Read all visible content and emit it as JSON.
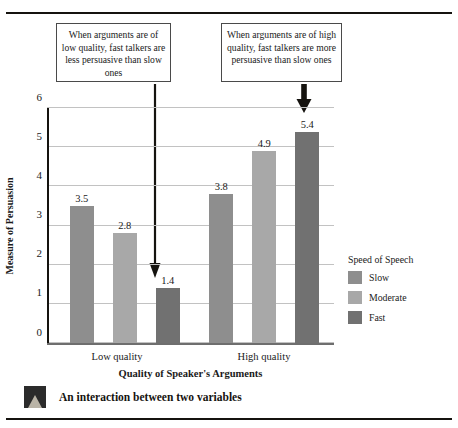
{
  "figure": {
    "caption": "An interaction between two variables",
    "caption_thumb_icon": "photo-thumbnail-icon"
  },
  "annotations": [
    {
      "id": "low-quality-note",
      "text": "When arguments are of low quality, fast talkers are less persuasive than slow ones",
      "arrow_icon": "down-arrow-icon",
      "points_to": "Low quality / Fast bar (1.4)"
    },
    {
      "id": "high-quality-note",
      "text": "When arguments are of high quality, fast talkers are more persuasive than slow ones",
      "arrow_icon": "down-arrow-icon",
      "points_to": "High quality / Fast bar (5.4)"
    }
  ],
  "legend": {
    "title": "Speed of Speech",
    "items": [
      {
        "label": "Slow",
        "color": "#8e8e8e"
      },
      {
        "label": "Moderate",
        "color": "#a8a8a8"
      },
      {
        "label": "Fast",
        "color": "#717171"
      }
    ]
  },
  "chart_data": {
    "type": "bar",
    "title": "",
    "xlabel": "Quality of Speaker's Arguments",
    "ylabel": "Measure of Persuasion",
    "categories": [
      "Low quality",
      "High quality"
    ],
    "series": [
      {
        "name": "Slow",
        "color": "#8e8e8e",
        "values": [
          3.5,
          3.8
        ]
      },
      {
        "name": "Moderate",
        "color": "#a8a8a8",
        "values": [
          2.8,
          4.9
        ]
      },
      {
        "name": "Fast",
        "color": "#717171",
        "values": [
          1.4,
          5.4
        ]
      }
    ],
    "ylim": [
      0,
      6
    ],
    "yticks": [
      0,
      1,
      2,
      3,
      4,
      5,
      6
    ],
    "ytick_labels": [
      "0",
      "1",
      "2",
      "3",
      "4",
      "5",
      "6"
    ],
    "grid": true,
    "grid_axis": "y",
    "legend_position": "right",
    "data_labels": true,
    "data_label_values": [
      "3.5",
      "2.8",
      "1.4",
      "3.8",
      "4.9",
      "5.4"
    ]
  }
}
